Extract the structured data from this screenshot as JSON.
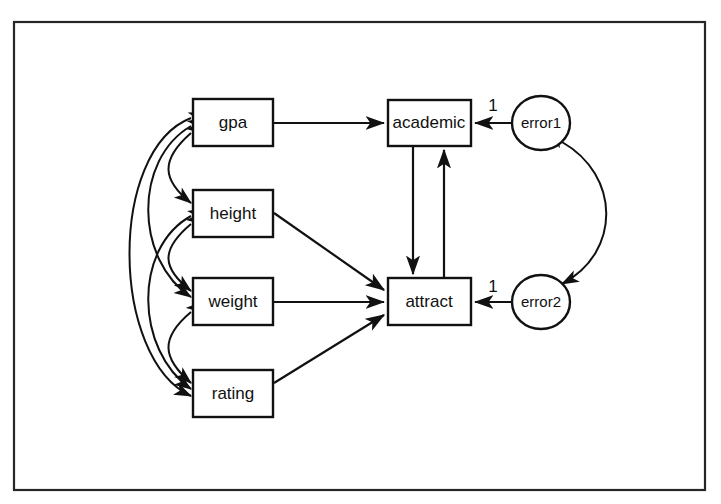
{
  "diagram": {
    "type": "path-diagram",
    "title": "",
    "frame": {
      "x": 14,
      "y": 22,
      "width": 691,
      "height": 468
    },
    "nodes": [
      {
        "id": "gpa",
        "label": "gpa",
        "shape": "rect",
        "x": 193,
        "y": 99,
        "width": 80,
        "height": 47
      },
      {
        "id": "height",
        "label": "height",
        "shape": "rect",
        "x": 193,
        "y": 190,
        "width": 80,
        "height": 47
      },
      {
        "id": "weight",
        "label": "weight",
        "shape": "rect",
        "x": 193,
        "y": 278,
        "width": 80,
        "height": 47
      },
      {
        "id": "rating",
        "label": "rating",
        "shape": "rect",
        "x": 193,
        "y": 370,
        "width": 80,
        "height": 47
      },
      {
        "id": "academic",
        "label": "academic",
        "shape": "rect",
        "x": 388,
        "y": 100,
        "width": 83,
        "height": 46
      },
      {
        "id": "attract",
        "label": "attract",
        "shape": "rect",
        "x": 388,
        "y": 278,
        "width": 83,
        "height": 47
      },
      {
        "id": "error1",
        "label": "error1",
        "shape": "ellipse",
        "cx": 541,
        "cy": 123,
        "rx": 29,
        "ry": 27
      },
      {
        "id": "error2",
        "label": "error2",
        "shape": "ellipse",
        "cx": 541,
        "cy": 302,
        "rx": 29,
        "ry": 27
      }
    ],
    "edges": [
      {
        "from": "gpa",
        "to": "academic",
        "kind": "directed"
      },
      {
        "from": "height",
        "to": "attract",
        "kind": "directed"
      },
      {
        "from": "weight",
        "to": "attract",
        "kind": "directed"
      },
      {
        "from": "rating",
        "to": "attract",
        "kind": "directed"
      },
      {
        "from": "academic",
        "to": "attract",
        "kind": "directed"
      },
      {
        "from": "attract",
        "to": "academic",
        "kind": "directed"
      },
      {
        "from": "error1",
        "to": "academic",
        "kind": "directed",
        "label": "1"
      },
      {
        "from": "error2",
        "to": "attract",
        "kind": "directed",
        "label": "1"
      },
      {
        "from": "error1",
        "to": "error2",
        "kind": "bidirected"
      },
      {
        "from": "gpa",
        "to": "height",
        "kind": "bidirected"
      },
      {
        "from": "gpa",
        "to": "weight",
        "kind": "bidirected"
      },
      {
        "from": "gpa",
        "to": "rating",
        "kind": "bidirected"
      },
      {
        "from": "height",
        "to": "weight",
        "kind": "bidirected"
      },
      {
        "from": "height",
        "to": "rating",
        "kind": "bidirected"
      },
      {
        "from": "weight",
        "to": "rating",
        "kind": "bidirected"
      }
    ],
    "labels": {
      "gpa": "gpa",
      "height": "height",
      "weight": "weight",
      "rating": "rating",
      "academic": "academic",
      "attract": "attract",
      "error1": "error1",
      "error2": "error2",
      "error1_coef": "1",
      "error2_coef": "1"
    },
    "colors": {
      "stroke": "#111111",
      "fill": "#ffffff",
      "frame": "#262626",
      "text": "#101010"
    }
  }
}
